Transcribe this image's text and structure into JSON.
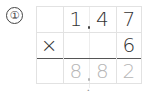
{
  "problem": {
    "label": "①",
    "multiplicand": [
      "",
      "1",
      "4",
      "7"
    ],
    "multiplier_row": [
      "×",
      "",
      "",
      "6"
    ],
    "answer": [
      "",
      "8",
      "8",
      "2"
    ],
    "multiplicand_text": "1.47",
    "multiplier_text": "6",
    "answer_text": "8.82"
  },
  "colors": {
    "digits": "#333333",
    "answer_digits": "#b5b5b5",
    "grid_lines": "#e2e2e2",
    "result_line": "#555555"
  }
}
